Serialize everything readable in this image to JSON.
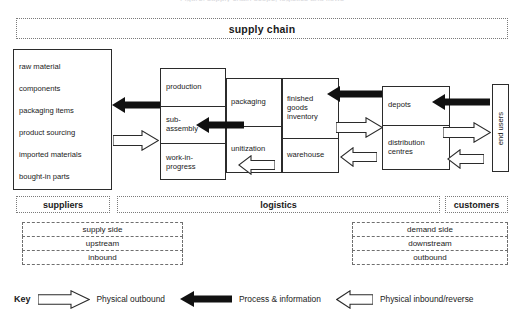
{
  "caption": "Figure: supply chain scope, logistics and flows",
  "banner": {
    "label": "supply chain"
  },
  "suppliers_list": {
    "items": [
      "raw  material",
      "components",
      "packaging  items",
      "product sourcing",
      "imported materials",
      "bought-in parts"
    ]
  },
  "production_box": {
    "rows": [
      "production",
      "sub-\nassembly",
      "work-in-\nprogress"
    ]
  },
  "packaging_box": {
    "rows": [
      "packaging",
      "unitization"
    ]
  },
  "finished_goods_box": {
    "rows": [
      "finished\ngoods\ninventory",
      "warehouse"
    ]
  },
  "depots_box": {
    "rows": [
      "depots",
      "distribution\ncentres"
    ]
  },
  "end_users_box": {
    "label": "end users"
  },
  "bands": {
    "suppliers": "suppliers",
    "logistics": "logistics",
    "customers": "customers",
    "left_stack": [
      "supply side",
      "upstream",
      "inbound"
    ],
    "right_stack": [
      "demand side",
      "downstream",
      "outbound"
    ]
  },
  "key": {
    "title": "Key",
    "items": [
      {
        "glyph": "outline-arrow-right",
        "label": "Physical outbound"
      },
      {
        "glyph": "solid-arrow-left",
        "label": "Process & information"
      },
      {
        "glyph": "outline-arrow-left",
        "label": "Physical inbound/reverse"
      }
    ]
  },
  "colors": {
    "ink": "#1a1a1a",
    "border": "#2b2b2b",
    "dotted": "#7a7a7a",
    "dashed": "#6f6f6f",
    "solid_arrow": "#111111",
    "outline_arrow_stroke": "#2b2b2b",
    "outline_arrow_fill": "#ffffff"
  }
}
